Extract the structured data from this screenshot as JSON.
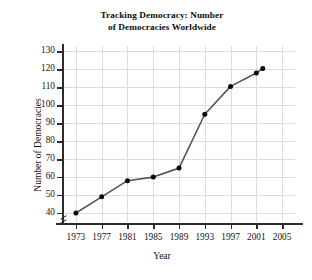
{
  "chart_data": {
    "type": "line",
    "title": "Tracking Democracy: Number of Democracies Worldwide",
    "title_lines": [
      "Tracking Democracy: Number",
      "of Democracies Worldwide"
    ],
    "xlabel": "Year",
    "ylabel": "Number of Democracies",
    "x": [
      1973,
      1977,
      1981,
      1985,
      1989,
      1993,
      1997,
      2001,
      2002
    ],
    "values": [
      40,
      49,
      58,
      60,
      65,
      95,
      110.5,
      118,
      120.5
    ],
    "points": [
      {
        "x": 1973,
        "y": 40
      },
      {
        "x": 1977,
        "y": 49
      },
      {
        "x": 1981,
        "y": 58
      },
      {
        "x": 1985,
        "y": 60
      },
      {
        "x": 1989,
        "y": 65
      },
      {
        "x": 1993,
        "y": 95
      },
      {
        "x": 1997,
        "y": 110.5
      },
      {
        "x": 2001,
        "y": 118
      },
      {
        "x": 2002,
        "y": 120.5
      }
    ],
    "xlim": [
      1971,
      2007
    ],
    "ylim": [
      35,
      133
    ],
    "xticks": [
      1973,
      1977,
      1981,
      1985,
      1989,
      1993,
      1997,
      2001,
      2005
    ],
    "xtick_labels": [
      "1973",
      "1977",
      "1981",
      "1985",
      "1989",
      "1993",
      "1997",
      "2001",
      "2005"
    ],
    "yticks": [
      40,
      50,
      60,
      70,
      80,
      90,
      100,
      110,
      120,
      130
    ],
    "ytick_labels": [
      "40",
      "50",
      "60",
      "70",
      "80",
      "90",
      "100",
      "110",
      "120",
      "130"
    ],
    "grid": true,
    "legend": false,
    "axis_break": true,
    "line_color": "#555555",
    "marker_color": "#0a0a0a",
    "grid_color": "#dcdcdc",
    "axis_color": "#2b2b2b",
    "background_color": "#ffffff"
  }
}
